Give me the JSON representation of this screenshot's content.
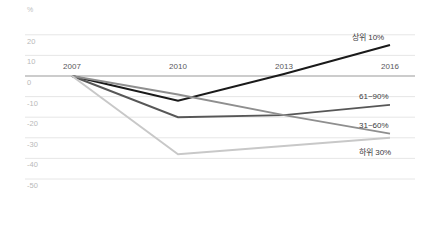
{
  "chart_data": {
    "type": "line",
    "title": "",
    "subtitle": "",
    "xlabel": "",
    "ylabel": "%",
    "unit_label": "%",
    "x": [
      "2007",
      "2010",
      "2013",
      "2016"
    ],
    "categories": [
      "2007",
      "2010",
      "2013",
      "2016"
    ],
    "xtick_labels": [
      "2007",
      "2010",
      "2013",
      "2016"
    ],
    "ytick_labels": [
      "20",
      "10",
      "0",
      "-10",
      "-20",
      "-30",
      "-40",
      "-50"
    ],
    "ytick_values": [
      20,
      10,
      0,
      -10,
      -20,
      -30,
      -40,
      -50
    ],
    "ylim": [
      -50,
      20
    ],
    "grid": true,
    "grid_axis": "y",
    "zero_line": 0,
    "legend_position": "inline-right",
    "series": [
      {
        "name": "상위 10%",
        "label": "상위 10%",
        "color": "#1a1a1a",
        "values": [
          0,
          -12,
          1,
          15
        ],
        "end_value": 15
      },
      {
        "name": "61~90%",
        "label": "61~90%",
        "color": "#575757",
        "values": [
          0,
          -20,
          -19,
          -14
        ],
        "end_value": -14
      },
      {
        "name": "31~60%",
        "label": "31~60%",
        "color": "#8f8f8f",
        "values": [
          0,
          -9,
          -19,
          -28
        ],
        "end_value": -28
      },
      {
        "name": "하위 30%",
        "label": "하위 30%",
        "color": "#c8c8c8",
        "values": [
          0,
          -38,
          -34,
          -30
        ],
        "end_value": -30
      }
    ]
  },
  "colors": {
    "background": "#ffffff",
    "gridline": "#e3e3e3",
    "zero_line": "#9a9a9a",
    "ytick_text": "#b9b9b9",
    "xtick_text": "#58585a",
    "series_label_text": "#3a3a3c"
  }
}
